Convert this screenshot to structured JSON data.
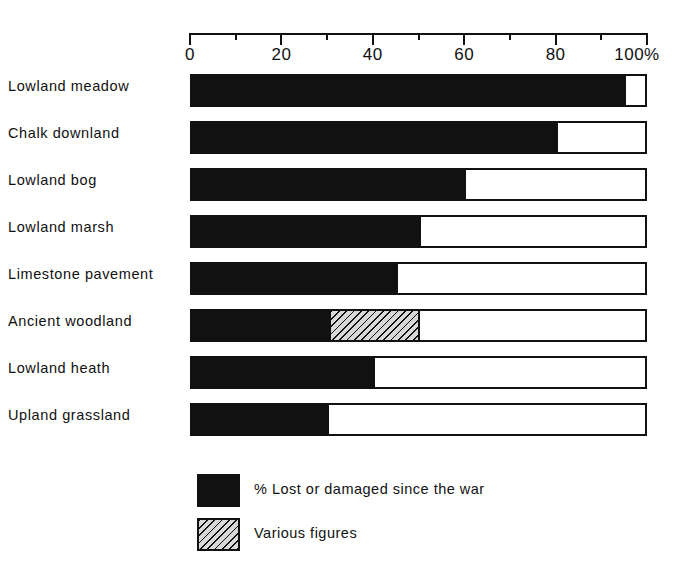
{
  "chart_data": {
    "type": "bar",
    "orientation": "horizontal",
    "stacked": true,
    "title": "",
    "xlabel": "",
    "ylabel": "",
    "xlim": [
      0,
      100
    ],
    "x_unit": "%",
    "grid": false,
    "axis_position": "top",
    "categories": [
      "Lowland meadow",
      "Chalk downland",
      "Lowland bog",
      "Lowland marsh",
      "Limestone pavement",
      "Ancient woodland",
      "Lowland heath",
      "Upland grassland"
    ],
    "series": [
      {
        "name": "% Lost or damaged since the war",
        "swatch": "solid-black",
        "color": "#111111",
        "values": [
          95,
          80,
          60,
          50,
          45,
          30,
          40,
          30
        ]
      },
      {
        "name": "Various figures",
        "swatch": "hatched",
        "color": "#d8d8d8",
        "values": [
          0,
          0,
          0,
          0,
          0,
          20,
          0,
          0
        ]
      }
    ],
    "tick_values_major": [
      0,
      20,
      40,
      60,
      80,
      100
    ],
    "tick_values_minor": [
      10,
      30,
      50,
      70,
      90
    ],
    "tick_labels": [
      "0",
      "20",
      "40",
      "60",
      "80",
      "100%"
    ],
    "legend": {
      "position": "bottom-left",
      "entries": [
        {
          "label": "% Lost or damaged since the war",
          "swatch": "solid-black"
        },
        {
          "label": "Various figures",
          "swatch": "hatched"
        }
      ]
    }
  },
  "colors": {
    "ink": "#111111",
    "paper": "#ffffff",
    "hatch_fill": "#d8d8d8"
  }
}
